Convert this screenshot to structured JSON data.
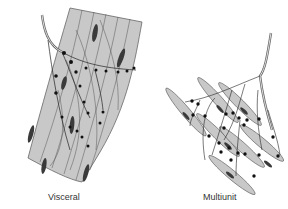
{
  "figure": {
    "panels": [
      {
        "id": "visceral",
        "label": "Visceral"
      },
      {
        "id": "multiunit",
        "label": "Multiunit"
      }
    ],
    "colors": {
      "muscle_fill": "#c8c8c8",
      "outline": "#555555",
      "nerve_dot": "#111111",
      "nucleus": "#3a3a3a",
      "label_text": "#333333"
    }
  }
}
